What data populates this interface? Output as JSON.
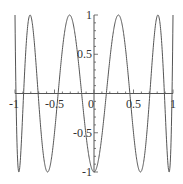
{
  "chart_data": {
    "type": "line",
    "title": "",
    "xlabel": "",
    "ylabel": "",
    "function": "cos(10*arccos(x)) (Chebyshev T_10)",
    "xlim": [
      -1,
      1
    ],
    "ylim": [
      -1,
      1
    ],
    "grid": false,
    "legend": null,
    "x_ticks": [
      -1,
      -0.5,
      0,
      0.5,
      1
    ],
    "x_tick_labels": [
      "-1",
      "-0.5",
      "0",
      "0.5",
      "1"
    ],
    "y_ticks": [
      -1,
      -0.5,
      0.5,
      1
    ],
    "y_tick_labels": [
      "-1",
      "-0.5",
      "0.5",
      "1"
    ],
    "series": [
      {
        "name": "T10",
        "color": "#555555",
        "extrema": [
          {
            "x": -1,
            "y": 1
          },
          {
            "x": -0.951,
            "y": -1
          },
          {
            "x": -0.809,
            "y": 1
          },
          {
            "x": -0.588,
            "y": -1
          },
          {
            "x": -0.309,
            "y": 1
          },
          {
            "x": 0,
            "y": -1
          },
          {
            "x": 0.309,
            "y": 1
          },
          {
            "x": 0.588,
            "y": -1
          },
          {
            "x": 0.809,
            "y": 1
          },
          {
            "x": 0.951,
            "y": -1
          },
          {
            "x": 1,
            "y": 1
          }
        ]
      }
    ]
  },
  "style": {
    "axis_color": "#555555",
    "curve_color": "#555555",
    "label_color": "#333333"
  }
}
